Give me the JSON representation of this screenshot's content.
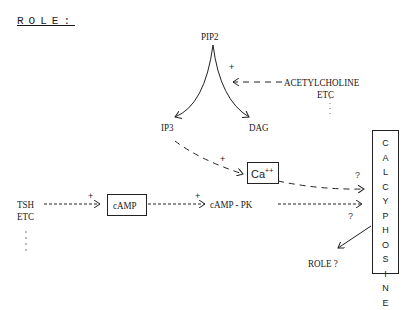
{
  "title": "ROLE:",
  "nodes": {
    "pip2": "PIP2",
    "acetylcholine": "ACETYLCHOLINE",
    "acetylcholine_etc": "ETC",
    "ip3": "IP3",
    "dag": "DAG",
    "ca": "Ca",
    "ca_sup": "++",
    "tsh": "TSH",
    "tsh_etc": "ETC",
    "camp": "cAMP",
    "camp_pk": "cAMP - PK",
    "role": "ROLE ?",
    "calcyphosine": [
      "C",
      "A",
      "L",
      "C",
      "Y",
      "P",
      "H",
      "O",
      "S",
      "I",
      "N",
      "E"
    ]
  },
  "labels": {
    "plus": "+",
    "question": "?"
  }
}
